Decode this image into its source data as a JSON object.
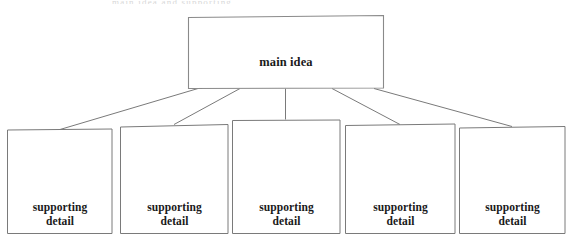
{
  "page": {
    "background_color": "#ffffff",
    "width": 571,
    "height": 247
  },
  "diagram": {
    "type": "hierarchy",
    "stroke_color": "#7a7a7a",
    "text_color": "#1a1a1a",
    "top_cut_text": "main idea and supporting",
    "main_node": {
      "label": "main idea",
      "box": {
        "x": 188,
        "y": 16,
        "width": 196,
        "height": 72
      }
    },
    "child_nodes": [
      {
        "label": "supporting\ndetail",
        "box": {
          "x": 7,
          "y": 129,
          "width": 105,
          "height": 105
        }
      },
      {
        "label": "supporting\ndetail",
        "box": {
          "x": 120,
          "y": 124,
          "width": 108,
          "height": 110
        }
      },
      {
        "label": "supporting\ndetail",
        "box": {
          "x": 232,
          "y": 119,
          "width": 108,
          "height": 115
        }
      },
      {
        "label": "supporting\ndetail",
        "box": {
          "x": 345,
          "y": 124,
          "width": 110,
          "height": 110
        }
      },
      {
        "label": "supporting\ndetail",
        "box": {
          "x": 459,
          "y": 126,
          "width": 106,
          "height": 108
        }
      }
    ],
    "connectors": [
      {
        "from_x": 198,
        "from_y": 88,
        "to_x": 60,
        "to_y": 129
      },
      {
        "from_x": 240,
        "from_y": 88,
        "to_x": 174,
        "to_y": 124
      },
      {
        "from_x": 286,
        "from_y": 88,
        "to_x": 286,
        "to_y": 119
      },
      {
        "from_x": 332,
        "from_y": 88,
        "to_x": 400,
        "to_y": 124
      },
      {
        "from_x": 374,
        "from_y": 88,
        "to_x": 512,
        "to_y": 126
      }
    ]
  }
}
